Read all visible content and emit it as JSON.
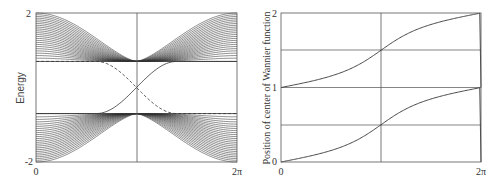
{
  "chart_data": [
    {
      "type": "line",
      "title": "",
      "xlabel": "",
      "ylabel": "Energy",
      "xlim": [
        0,
        6.2832
      ],
      "ylim": [
        -2,
        2
      ],
      "x_tick_labels": [
        "0",
        "2π"
      ],
      "y_tick_labels": [
        "-2",
        "2"
      ],
      "grid": false,
      "reference_lines": {
        "vertical_x": 3.1416
      },
      "series": [
        {
          "name": "upper bulk bands",
          "style": "solid",
          "count": 24,
          "description": "band family between E=2 (at k=0,2π) and E≈0.7 (at k=π)",
          "envelope_min": 0.7,
          "envelope_max": 2.0
        },
        {
          "name": "lower bulk bands",
          "style": "solid",
          "count": 24,
          "description": "mirror of upper bands, between E=-2 and E≈-0.7",
          "envelope_min": -2.0,
          "envelope_max": -0.7
        },
        {
          "name": "edge state (solid)",
          "style": "solid",
          "x": [
            0,
            1.88,
            2.5,
            3.1416,
            3.78,
            4.4,
            6.2832
          ],
          "y": [
            -0.7,
            -0.7,
            -0.45,
            0.0,
            0.45,
            0.7,
            0.7
          ]
        },
        {
          "name": "edge state (dashed)",
          "style": "dashed",
          "x": [
            0,
            1.88,
            2.5,
            3.1416,
            3.78,
            4.4,
            6.2832
          ],
          "y": [
            0.7,
            0.7,
            0.45,
            0.0,
            -0.45,
            -0.7,
            -0.7
          ]
        }
      ]
    },
    {
      "type": "line",
      "title": "",
      "xlabel": "",
      "ylabel": "Position of center of Wannier function",
      "xlim": [
        0,
        6.2832
      ],
      "ylim": [
        0,
        2
      ],
      "x_tick_labels": [
        "0",
        "2π"
      ],
      "y_tick_labels": [
        "0",
        "1",
        "2"
      ],
      "grid": true,
      "gridlines_y": [
        0.5,
        1.0,
        1.5
      ],
      "reference_lines": {
        "vertical_x": 3.1416
      },
      "series": [
        {
          "name": "Wannier center (lower)",
          "style": "solid",
          "x": [
            0,
            1.0,
            2.0,
            2.6,
            3.1416,
            3.7,
            4.3,
            5.3,
            6.2832
          ],
          "y": [
            0.0,
            0.05,
            0.15,
            0.28,
            0.5,
            0.72,
            0.85,
            0.95,
            1.0
          ]
        },
        {
          "name": "Wannier center (upper)",
          "style": "solid",
          "x": [
            0,
            1.0,
            2.0,
            2.6,
            3.1416,
            3.7,
            4.3,
            5.3,
            6.2832
          ],
          "y": [
            1.0,
            1.05,
            1.15,
            1.28,
            1.5,
            1.72,
            1.85,
            1.95,
            2.0
          ]
        }
      ]
    }
  ],
  "left": {
    "ylabel": "Energy",
    "ytick_top": "2",
    "ytick_bottom": "-2",
    "xtick_left": "0",
    "xtick_right": "2π"
  },
  "right": {
    "ylabel": "Position of center of Wannier function",
    "ytick_top": "2",
    "ytick_mid": "1",
    "ytick_bottom": "0",
    "xtick_left": "0",
    "xtick_right": "2π"
  },
  "colors": {
    "line": "#333333",
    "axis": "#555555",
    "grid": "#666666"
  }
}
